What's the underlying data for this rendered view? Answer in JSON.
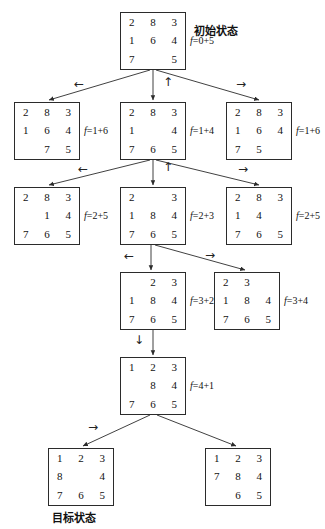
{
  "diagram": {
    "title_note": "A* search tree for the 8-puzzle",
    "initial_label": "初始状态",
    "goal_label": "目标状态"
  },
  "nodes": [
    {
      "id": "n0",
      "tiles": [
        "2",
        "8",
        "3",
        "1",
        "6",
        "4",
        "7",
        "",
        "5"
      ],
      "f": "f=0+5",
      "x": 120,
      "y": 12,
      "w": 66,
      "h": 58
    },
    {
      "id": "n1",
      "tiles": [
        "2",
        "8",
        "3",
        "1",
        "6",
        "4",
        "",
        "7",
        "5"
      ],
      "f": "f=1+6",
      "x": 14,
      "y": 102,
      "w": 66,
      "h": 58
    },
    {
      "id": "n2",
      "tiles": [
        "2",
        "8",
        "3",
        "1",
        "",
        "4",
        "7",
        "6",
        "5"
      ],
      "f": "f=1+4",
      "x": 120,
      "y": 102,
      "w": 66,
      "h": 58
    },
    {
      "id": "n3",
      "tiles": [
        "2",
        "8",
        "3",
        "1",
        "6",
        "4",
        "7",
        "5",
        ""
      ],
      "f": "f=1+6",
      "x": 226,
      "y": 102,
      "w": 66,
      "h": 58
    },
    {
      "id": "n4",
      "tiles": [
        "2",
        "8",
        "3",
        "",
        "1",
        "4",
        "7",
        "6",
        "5"
      ],
      "f": "f=2+5",
      "x": 14,
      "y": 187,
      "w": 66,
      "h": 58
    },
    {
      "id": "n5",
      "tiles": [
        "2",
        "",
        "3",
        "1",
        "8",
        "4",
        "7",
        "6",
        "5"
      ],
      "f": "f=2+3",
      "x": 120,
      "y": 187,
      "w": 66,
      "h": 58
    },
    {
      "id": "n6",
      "tiles": [
        "2",
        "8",
        "3",
        "1",
        "4",
        "",
        "7",
        "6",
        "5"
      ],
      "f": "f=2+5",
      "x": 226,
      "y": 187,
      "w": 66,
      "h": 58
    },
    {
      "id": "n7",
      "tiles": [
        "",
        "2",
        "3",
        "1",
        "8",
        "4",
        "7",
        "6",
        "5"
      ],
      "f": "f=3+2",
      "x": 120,
      "y": 272,
      "w": 66,
      "h": 58
    },
    {
      "id": "n8",
      "tiles": [
        "2",
        "3",
        "",
        "1",
        "8",
        "4",
        "7",
        "6",
        "5"
      ],
      "f": "f=3+4",
      "x": 214,
      "y": 272,
      "w": 66,
      "h": 58
    },
    {
      "id": "n9",
      "tiles": [
        "1",
        "2",
        "3",
        "",
        "8",
        "4",
        "7",
        "6",
        "5"
      ],
      "f": "f=4+1",
      "x": 120,
      "y": 357,
      "w": 66,
      "h": 58
    },
    {
      "id": "n10",
      "tiles": [
        "1",
        "2",
        "3",
        "8",
        "",
        "4",
        "7",
        "6",
        "5"
      ],
      "f": "",
      "x": 48,
      "y": 448,
      "w": 66,
      "h": 58
    },
    {
      "id": "n11",
      "tiles": [
        "1",
        "2",
        "3",
        "7",
        "8",
        "4",
        "",
        "6",
        "5"
      ],
      "f": "",
      "x": 205,
      "y": 448,
      "w": 66,
      "h": 58
    }
  ],
  "edge_ops": [
    {
      "glyph": "←",
      "x": 74,
      "y": 78
    },
    {
      "glyph": "↑",
      "x": 163,
      "y": 76
    },
    {
      "glyph": "→",
      "x": 236,
      "y": 78
    },
    {
      "glyph": "←",
      "x": 78,
      "y": 163
    },
    {
      "glyph": "↑",
      "x": 163,
      "y": 161
    },
    {
      "glyph": "→",
      "x": 238,
      "y": 163
    },
    {
      "glyph": "←",
      "x": 124,
      "y": 250
    },
    {
      "glyph": "→",
      "x": 205,
      "y": 249
    },
    {
      "glyph": "↓",
      "x": 134,
      "y": 334
    },
    {
      "glyph": "→",
      "x": 88,
      "y": 421
    }
  ],
  "labels": [
    {
      "key": "initial",
      "text": "初始状态",
      "x": 194,
      "y": 22
    },
    {
      "key": "goal",
      "text": "目标状态",
      "x": 52,
      "y": 509
    }
  ],
  "colors": {
    "stroke": "#2b2b2b",
    "text": "#111111",
    "background": "#ffffff"
  }
}
